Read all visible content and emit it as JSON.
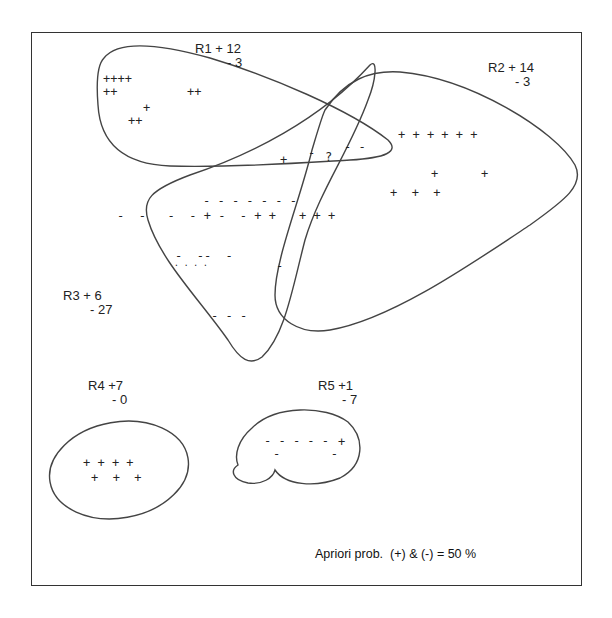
{
  "diagram": {
    "regions": [
      {
        "id": "R1",
        "pos": "+ 12",
        "neg": "- 3",
        "label": "R1 + 12",
        "sub": "- 3"
      },
      {
        "id": "R2",
        "pos": "+ 14",
        "neg": "- 3",
        "label": "R2 + 14",
        "sub": "- 3"
      },
      {
        "id": "R3",
        "pos": "+ 6",
        "neg": "- 27",
        "label": "R3 + 6",
        "sub": "- 27"
      },
      {
        "id": "R4",
        "pos": "+7",
        "neg": "- 0",
        "label": "R4 +7",
        "sub": "- 0"
      },
      {
        "id": "R5",
        "pos": "+1",
        "neg": "- 7",
        "label": "R5 +1",
        "sub": "- 7"
      }
    ],
    "points": {
      "r1_row1": "++++",
      "r1_row2": "++",
      "r1_row2b": "++",
      "r1_row3": "+",
      "r1_row4": "++",
      "overlap_plus": "+",
      "overlap_minus": "-",
      "overlap_question": "?",
      "overlap_minus2": "- -",
      "r2_row1": "+ + + + + +",
      "r2_row2a": "+",
      "r2_row2b": "+",
      "r2_row3": "+  +  +",
      "r3_dashes_top": "- - - - - - -",
      "r3_mixed_row": "-  -   -  - + -  - + +",
      "r3_plus_row": "+ + +",
      "r3_small1": "-  --  -",
      "r3_small2": ". . . .",
      "r3_minus_lone": "-",
      "r3_bottom": "- - -",
      "r4_row1": "+ + + +",
      "r4_row2": "+  +  +",
      "r5_row1": "- - - - -",
      "r5_plus": "+",
      "r5_row2": "-       -"
    },
    "note": "Apriori prob.  (+) & (-) = 50 %"
  }
}
